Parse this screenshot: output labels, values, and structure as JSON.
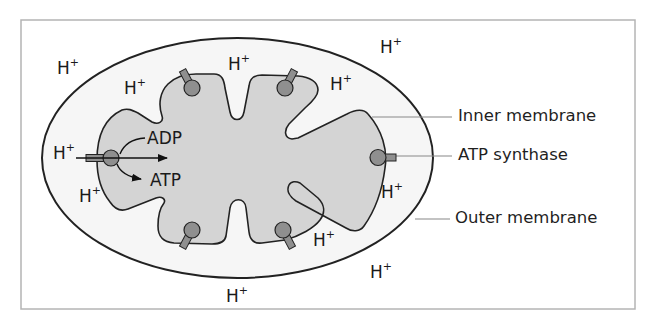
{
  "figure": {
    "colors": {
      "frame": "#b4b4b4",
      "intermembrane": "#f6f6f6",
      "matrix": "#d4d4d4",
      "outline": "#222222",
      "synthase_fill": "#8f8f8f",
      "leader_line": "#888888"
    }
  },
  "ions": [
    {
      "id": "h1",
      "base": "H",
      "sup": "+",
      "x": 57,
      "y": 60
    },
    {
      "id": "h2",
      "base": "H",
      "sup": "+",
      "x": 124,
      "y": 80
    },
    {
      "id": "h3",
      "base": "H",
      "sup": "+",
      "x": 228,
      "y": 56
    },
    {
      "id": "h4",
      "base": "H",
      "sup": "+",
      "x": 330,
      "y": 76
    },
    {
      "id": "h5",
      "base": "H",
      "sup": "+",
      "x": 380,
      "y": 39
    },
    {
      "id": "h6",
      "base": "H",
      "sup": "+",
      "x": 53,
      "y": 145
    },
    {
      "id": "h7",
      "base": "H",
      "sup": "+",
      "x": 79,
      "y": 188
    },
    {
      "id": "h8",
      "base": "H",
      "sup": "+",
      "x": 381,
      "y": 184
    },
    {
      "id": "h9",
      "base": "H",
      "sup": "+",
      "x": 313,
      "y": 232
    },
    {
      "id": "h10",
      "base": "H",
      "sup": "+",
      "x": 370,
      "y": 264
    },
    {
      "id": "h11",
      "base": "H",
      "sup": "+",
      "x": 226,
      "y": 288
    }
  ],
  "reaction": {
    "substrate": "ADP",
    "product": "ATP"
  },
  "callouts": [
    {
      "id": "inner",
      "label": "Inner membrane",
      "x": 458,
      "y": 111
    },
    {
      "id": "synthase",
      "label": "ATP synthase",
      "x": 458,
      "y": 149
    },
    {
      "id": "outer",
      "label": "Outer membrane",
      "x": 455,
      "y": 208
    }
  ]
}
